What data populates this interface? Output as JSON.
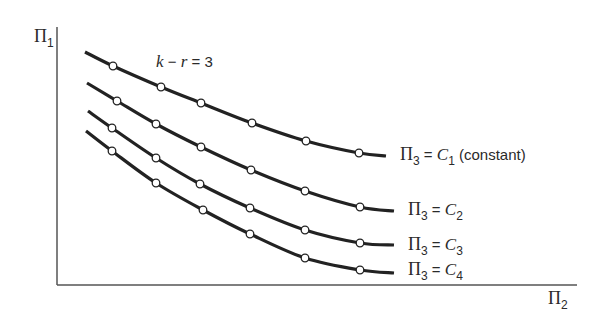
{
  "figure": {
    "y_axis_label": {
      "symbol": "Π",
      "subscript": "1"
    },
    "x_axis_label": {
      "symbol": "Π",
      "subscript": "2"
    },
    "annotation": {
      "k": "k",
      "minus": " − ",
      "r": "r",
      "eq": " = 3"
    },
    "curve_labels": [
      {
        "lhs_symbol": "Π",
        "lhs_sub": "3",
        "eq": " = ",
        "rhs_symbol": "C",
        "rhs_sub": "1",
        "note": " (constant)"
      },
      {
        "lhs_symbol": "Π",
        "lhs_sub": "3",
        "eq": " = ",
        "rhs_symbol": "C",
        "rhs_sub": "2",
        "note": ""
      },
      {
        "lhs_symbol": "Π",
        "lhs_sub": "3",
        "eq": " = ",
        "rhs_symbol": "C",
        "rhs_sub": "3",
        "note": ""
      },
      {
        "lhs_symbol": "Π",
        "lhs_sub": "3",
        "eq": " = ",
        "rhs_symbol": "C",
        "rhs_sub": "4",
        "note": ""
      }
    ],
    "colors": {
      "curve": "#222222",
      "axis": "#555555",
      "marker_fill": "#ffffff",
      "text": "#2a2a2a"
    }
  },
  "chart_data": {
    "type": "line",
    "title": "",
    "annotation": "k − r = 3",
    "xlabel": "Π2",
    "ylabel": "Π1",
    "grid": false,
    "axis_ticks": "none (qualitative sketch)",
    "series": [
      {
        "name": "Π3 = C1 (constant)",
        "path": [
          [
            85,
            52
          ],
          [
            113,
            66
          ],
          [
            161,
            87
          ],
          [
            201,
            103
          ],
          [
            252,
            123
          ],
          [
            306,
            141
          ],
          [
            359,
            153
          ],
          [
            386,
            156
          ]
        ],
        "markers": [
          [
            113,
            66
          ],
          [
            161,
            87
          ],
          [
            201,
            103
          ],
          [
            252,
            123
          ],
          [
            306,
            141
          ],
          [
            359,
            153
          ]
        ]
      },
      {
        "name": "Π3 = C2",
        "path": [
          [
            87,
            83
          ],
          [
            117,
            101
          ],
          [
            156,
            124
          ],
          [
            201,
            147
          ],
          [
            251,
            170
          ],
          [
            305,
            191
          ],
          [
            360,
            207
          ],
          [
            394,
            211
          ]
        ],
        "markers": [
          [
            117,
            101
          ],
          [
            156,
            124
          ],
          [
            201,
            147
          ],
          [
            251,
            170
          ],
          [
            305,
            191
          ],
          [
            360,
            207
          ]
        ]
      },
      {
        "name": "Π3 = C3",
        "path": [
          [
            88,
            111
          ],
          [
            112,
            128
          ],
          [
            156,
            158
          ],
          [
            200,
            184
          ],
          [
            250,
            208
          ],
          [
            305,
            230
          ],
          [
            360,
            243
          ],
          [
            394,
            245
          ]
        ],
        "markers": [
          [
            112,
            128
          ],
          [
            156,
            158
          ],
          [
            200,
            184
          ],
          [
            250,
            208
          ],
          [
            305,
            230
          ],
          [
            360,
            243
          ]
        ]
      },
      {
        "name": "Π3 = C4",
        "path": [
          [
            86,
            131
          ],
          [
            112,
            151
          ],
          [
            156,
            183
          ],
          [
            203,
            210
          ],
          [
            250,
            234
          ],
          [
            305,
            258
          ],
          [
            360,
            270
          ],
          [
            394,
            273
          ]
        ],
        "markers": [
          [
            112,
            151
          ],
          [
            156,
            183
          ],
          [
            203,
            210
          ],
          [
            250,
            234
          ],
          [
            305,
            258
          ],
          [
            360,
            270
          ]
        ]
      }
    ],
    "note": "Values are pixel positions in a qualitative dimensionless-group plot; no numeric axis scale shown."
  }
}
